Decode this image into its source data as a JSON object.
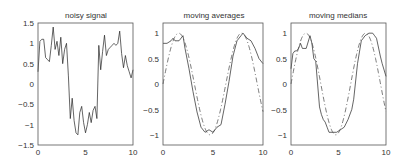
{
  "chart_data": [
    {
      "type": "line",
      "title": "noisy signal",
      "xlabel": "",
      "ylabel": "",
      "xlim": [
        0,
        10
      ],
      "ylim": [
        -1.5,
        1.5
      ],
      "xticks": [
        0,
        5,
        10
      ],
      "xtick_labels": [
        "0",
        "5",
        "10"
      ],
      "yticks": [
        -1.5,
        -1,
        -0.5,
        0,
        0.5,
        1,
        1.5
      ],
      "ytick_labels": [
        "-1.5",
        "-1",
        "-0.5",
        "0",
        "0.5",
        "1",
        "1.5"
      ],
      "grid": false,
      "series": [
        {
          "name": "noisy signal",
          "style": "solid",
          "x": [
            0,
            0.2,
            0.4,
            0.6,
            0.8,
            1.0,
            1.2,
            1.4,
            1.6,
            1.8,
            2.0,
            2.2,
            2.4,
            2.6,
            2.8,
            3.0,
            3.2,
            3.4,
            3.6,
            3.8,
            4.0,
            4.2,
            4.4,
            4.6,
            4.8,
            5.0,
            5.2,
            5.4,
            5.6,
            5.8,
            6.0,
            6.2,
            6.4,
            6.6,
            6.8,
            7.0,
            7.2,
            7.4,
            7.6,
            7.8,
            8.0,
            8.2,
            8.4,
            8.6,
            8.8,
            9.0,
            9.2,
            9.4,
            9.6,
            9.8,
            10.0
          ],
          "values": [
            0.3,
            1.05,
            1.1,
            1.1,
            0.65,
            0.6,
            0.55,
            0.95,
            1.4,
            0.85,
            1.05,
            0.7,
            1.15,
            0.5,
            0.85,
            1.0,
            0.2,
            -0.85,
            -0.35,
            -0.9,
            -1.2,
            -1.25,
            -0.7,
            -0.55,
            -0.95,
            -1.2,
            -1.0,
            -0.7,
            -0.95,
            -0.65,
            -0.55,
            -0.85,
            0.95,
            0.35,
            0.8,
            1.2,
            0.7,
            0.85,
            0.9,
            0.95,
            1.0,
            0.95,
            1.0,
            1.3,
            0.75,
            0.4,
            0.7,
            0.45,
            0.3,
            0.15,
            0.35
          ]
        }
      ]
    },
    {
      "type": "line",
      "title": "moving averages",
      "xlabel": "",
      "ylabel": "",
      "xlim": [
        0,
        10
      ],
      "ylim": [
        -1.2,
        1.2
      ],
      "xticks": [
        0,
        5,
        10
      ],
      "xtick_labels": [
        "0",
        "5",
        "10"
      ],
      "yticks": [
        -1,
        -0.5,
        0,
        0.5,
        1
      ],
      "ytick_labels": [
        "-1",
        "-0.5",
        "0",
        "0.5",
        "1"
      ],
      "grid": false,
      "series": [
        {
          "name": "moving average",
          "style": "solid",
          "x": [
            0,
            0.4,
            0.8,
            1.0,
            1.2,
            1.6,
            2.0,
            2.2,
            2.6,
            3.0,
            3.4,
            3.8,
            4.2,
            4.6,
            5.0,
            5.4,
            5.8,
            6.2,
            6.6,
            7.0,
            7.4,
            7.8,
            8.0,
            8.4,
            8.8,
            9.2,
            9.6,
            10.0
          ],
          "values": [
            0.8,
            0.8,
            0.85,
            0.9,
            0.85,
            0.85,
            0.95,
            0.7,
            0.3,
            -0.15,
            -0.55,
            -0.85,
            -0.95,
            -0.9,
            -0.95,
            -0.85,
            -0.8,
            -0.4,
            0.05,
            0.55,
            0.85,
            0.95,
            1.0,
            0.9,
            0.85,
            0.7,
            0.5,
            0.4
          ]
        },
        {
          "name": "sin(x)",
          "style": "dash-dot",
          "function": "sin(x)"
        }
      ]
    },
    {
      "type": "line",
      "title": "moving medians",
      "xlabel": "",
      "ylabel": "",
      "xlim": [
        0,
        10
      ],
      "ylim": [
        -1.2,
        1.2
      ],
      "xticks": [
        0,
        5,
        10
      ],
      "xtick_labels": [
        "0",
        "5",
        "10"
      ],
      "yticks": [
        -1,
        -0.5,
        0,
        0.5,
        1
      ],
      "ytick_labels": [
        "-1",
        "-0.5",
        "0",
        "0.5",
        "1"
      ],
      "grid": false,
      "series": [
        {
          "name": "moving median",
          "style": "solid",
          "x": [
            0,
            0.2,
            0.4,
            0.6,
            0.8,
            1.0,
            1.2,
            1.6,
            2.0,
            2.2,
            2.4,
            2.6,
            2.8,
            3.0,
            3.2,
            3.4,
            3.6,
            3.8,
            4.0,
            4.4,
            4.8,
            5.2,
            5.6,
            6.0,
            6.4,
            6.6,
            7.0,
            7.4,
            7.8,
            8.2,
            8.6,
            8.8,
            9.0,
            9.4,
            9.6,
            10.0
          ],
          "values": [
            0.3,
            0.6,
            0.65,
            0.65,
            0.7,
            0.8,
            0.7,
            0.7,
            0.95,
            0.8,
            0.5,
            0.45,
            0.0,
            -0.45,
            -0.6,
            -0.7,
            -0.75,
            -0.85,
            -0.95,
            -0.95,
            -0.95,
            -0.9,
            -0.85,
            -0.7,
            -0.5,
            -0.3,
            0.4,
            0.85,
            0.95,
            1.0,
            1.0,
            0.95,
            0.9,
            0.55,
            0.4,
            0.15
          ]
        },
        {
          "name": "sin(x)",
          "style": "dash-dot",
          "function": "sin(x)"
        }
      ]
    }
  ],
  "panels": [
    {
      "title": "noisy signal",
      "xticks": [
        "0",
        "5",
        "10"
      ],
      "yticks": [
        "1.5",
        "1",
        "0.5",
        "0",
        "−0.5",
        "−1",
        "−1.5"
      ]
    },
    {
      "title": "moving averages",
      "xticks": [
        "0",
        "5",
        "10"
      ],
      "yticks": [
        "1",
        "0.5",
        "0",
        "−0.5",
        "−1"
      ]
    },
    {
      "title": "moving medians",
      "xticks": [
        "0",
        "5",
        "10"
      ],
      "yticks": [
        "1",
        "0.5",
        "0",
        "−0.5",
        "−1"
      ]
    }
  ]
}
